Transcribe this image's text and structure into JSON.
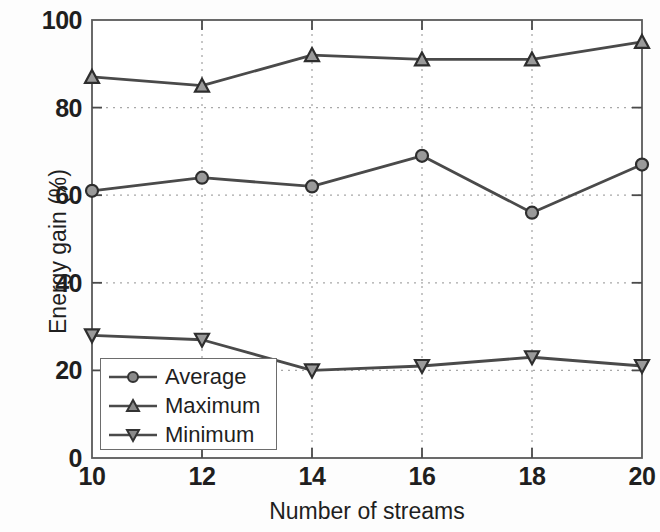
{
  "chart_data": {
    "type": "line",
    "title": "",
    "xlabel": "Number of streams",
    "ylabel": "Energy gain (%)",
    "x": [
      10,
      12,
      14,
      16,
      18,
      20
    ],
    "xticks": [
      "10",
      "12",
      "14",
      "16",
      "18",
      "20"
    ],
    "yticks": [
      "0",
      "20",
      "40",
      "60",
      "80",
      "100"
    ],
    "xlim": [
      10,
      20
    ],
    "ylim": [
      0,
      100
    ],
    "grid": "dotted-both-axes",
    "legend_position": "lower-left-inside",
    "series": [
      {
        "name": "Average",
        "marker": "circle",
        "color": "#4a4a4a",
        "values": [
          61,
          64,
          62,
          69,
          56,
          67
        ]
      },
      {
        "name": "Maximum",
        "marker": "triangle-up",
        "color": "#4a4a4a",
        "values": [
          87,
          85,
          92,
          91,
          91,
          95
        ]
      },
      {
        "name": "Minimum",
        "marker": "triangle-down",
        "color": "#4a4a4a",
        "values": [
          28,
          27,
          20,
          21,
          23,
          21
        ]
      }
    ]
  },
  "legend": {
    "items": [
      {
        "label": "Average",
        "marker": "circle-marker-icon"
      },
      {
        "label": "Maximum",
        "marker": "triangle-up-marker-icon"
      },
      {
        "label": "Minimum",
        "marker": "triangle-down-marker-icon"
      }
    ]
  },
  "axes": {
    "y_ticks": [
      "100",
      "80",
      "60",
      "40",
      "20",
      "0"
    ],
    "x_ticks": [
      "10",
      "12",
      "14",
      "16",
      "18",
      "20"
    ],
    "y_title": "Energy gain (%)",
    "x_title": "Number of streams"
  }
}
